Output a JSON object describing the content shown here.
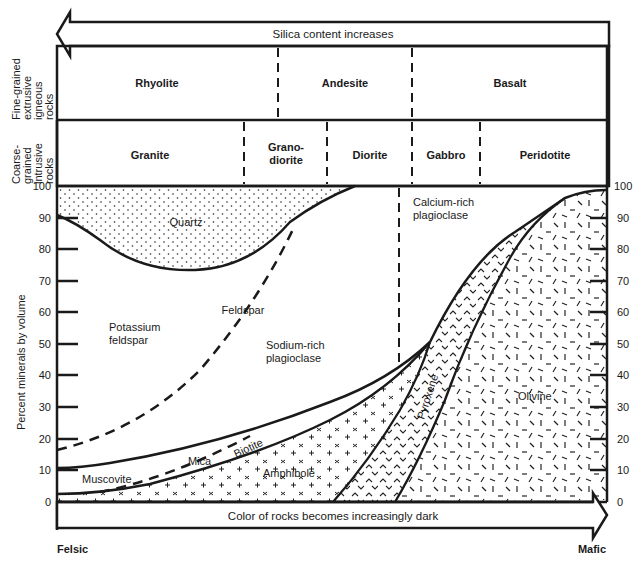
{
  "top_arrow": {
    "label": "Silica content increases",
    "direction": "left"
  },
  "bottom_arrow": {
    "label": "Color of rocks becomes increasingly dark",
    "direction": "right"
  },
  "row_labels": {
    "fine": [
      "Fine-grained",
      "extrusive",
      "igneous",
      "rocks"
    ],
    "coarse": [
      "Coarse-",
      "grained",
      "intrusive",
      "rocks"
    ]
  },
  "fine_rocks": [
    "Rhyolite",
    "Andesite",
    "Basalt"
  ],
  "coarse_rocks": {
    "granite": "Granite",
    "granodiorite": [
      "Grano-",
      "diorite"
    ],
    "diorite": "Diorite",
    "gabbro": "Gabbro",
    "peridotite": "Peridotite"
  },
  "y_axis": {
    "label": "Percent minerals by volume",
    "ticks": [
      "0",
      "10",
      "20",
      "30",
      "40",
      "50",
      "60",
      "70",
      "80",
      "90",
      "100"
    ]
  },
  "x_ends": {
    "left": "Felsic",
    "right": "Mafic"
  },
  "minerals": {
    "quartz": "Quartz",
    "feldspar": "Feldspar",
    "potassium_feldspar": [
      "Potassium",
      "feldspar"
    ],
    "sodium_plagioclase": [
      "Sodium-rich",
      "plagioclase"
    ],
    "calcium_plagioclase": [
      "Calcium-rich",
      "plagioclase"
    ],
    "muscovite": "Muscovite",
    "mica": "Mica",
    "biotite": "Biotite",
    "amphibole": "Amphibole",
    "pyroxene": "Pyroxene",
    "olivine": "Olivine"
  },
  "colors": {
    "ink": "#1a1a1a",
    "background": "#ffffff"
  }
}
